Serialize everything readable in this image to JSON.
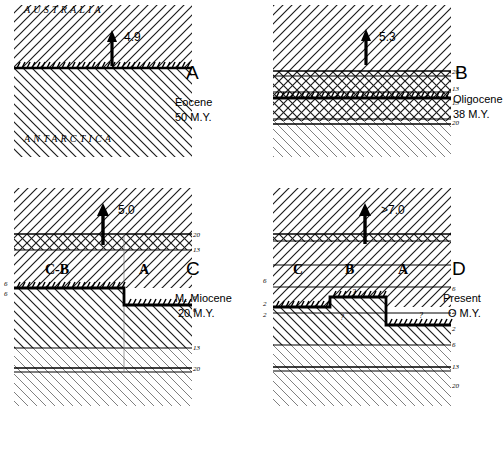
{
  "figure": {
    "panels": [
      {
        "id": "A",
        "letter": "A",
        "epoch": "Eocene",
        "age": "50 M.Y.",
        "rate": "4.9",
        "continents": {
          "top": "AUSTRALIA",
          "bottom": "ANTARCTICA"
        },
        "blocks": [],
        "anomalies_right": [],
        "anomalies_left": [],
        "questions": []
      },
      {
        "id": "B",
        "letter": "B",
        "epoch": "Oligocene",
        "age": "38 M.Y.",
        "rate": "5.3",
        "continents": {
          "top": "",
          "bottom": ""
        },
        "blocks": [],
        "anomalies_right": [
          "20",
          "13",
          "13",
          "20"
        ],
        "anomalies_left": [],
        "questions": []
      },
      {
        "id": "C",
        "letter": "C",
        "epoch": "M. Miocene",
        "age": "20 M.Y.",
        "rate": "5.0",
        "continents": {
          "top": "",
          "bottom": ""
        },
        "blocks": [
          "C-B",
          "A"
        ],
        "anomalies_right": [
          "20",
          "13",
          "6",
          "6",
          "13",
          "20"
        ],
        "anomalies_left": [
          "6",
          "6"
        ],
        "questions": []
      },
      {
        "id": "D",
        "letter": "D",
        "epoch": "Present",
        "age": "O M.Y.",
        "rate": ">7.0",
        "continents": {
          "top": "",
          "bottom": ""
        },
        "blocks": [
          "C",
          "B",
          "A"
        ],
        "anomalies_right": [
          "6",
          "2",
          "2",
          "6",
          "13",
          "20"
        ],
        "anomalies_left": [
          "6",
          "2",
          "2"
        ],
        "questions": [
          "?",
          "?",
          "?"
        ]
      }
    ],
    "colors": {
      "ink": "#000000",
      "paper": "#ffffff",
      "hatch": "#2b2b2b"
    }
  }
}
